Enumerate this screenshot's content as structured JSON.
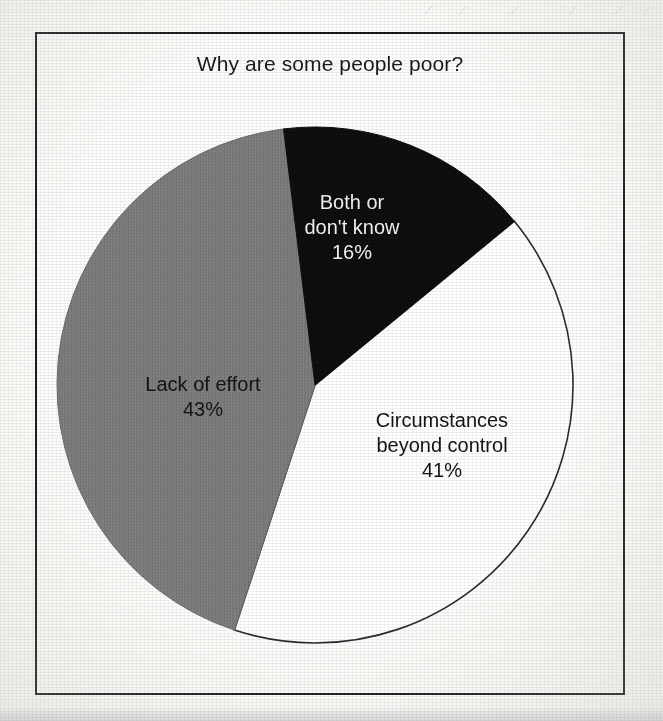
{
  "figure": {
    "title": "Why are some people poor?",
    "background_color": "#fdfdfb",
    "frame_color": "#18181a"
  },
  "chart_data": {
    "type": "pie",
    "title": "Why are some people poor?",
    "xlabel": "",
    "ylabel": "",
    "unit": "%",
    "total": 100,
    "legend_position": "none",
    "labels_inside_slices": true,
    "start_angle_deg": -7,
    "direction": "clockwise",
    "categories": [
      "Both or don't know",
      "Circumstances beyond control",
      "Lack of effort"
    ],
    "values": [
      16,
      41,
      43
    ],
    "slices": [
      {
        "name": "Both or don't know",
        "label_line1": "Both or",
        "label_line2": "don't know",
        "value": 16,
        "value_label": "16%",
        "fill": "#0d0d0f",
        "stroke": "#0d0d0f",
        "text_color": "#f4f4f2"
      },
      {
        "name": "Circumstances beyond control",
        "label_line1": "Circumstances",
        "label_line2": "beyond control",
        "value": 41,
        "value_label": "41%",
        "fill": "#ffffff",
        "stroke": "#2b2b2d",
        "text_color": "#141416"
      },
      {
        "name": "Lack of effort",
        "label_line1": "Lack of effort",
        "label_line2": "",
        "value": 43,
        "value_label": "43%",
        "fill": "#7d7d7d",
        "stroke": "#6f6f6f",
        "text_color": "#141416"
      }
    ]
  }
}
